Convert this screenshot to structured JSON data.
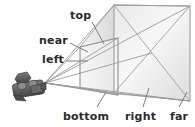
{
  "figure": {
    "background_color": "#ffffff",
    "width": 195,
    "height": 127
  },
  "labels": {
    "top": "top",
    "near": "near",
    "left": "left",
    "bottom": "bottom",
    "right": "right",
    "far": "far"
  },
  "colors": {
    "label_text": "#2b2b2b",
    "frustum_edge": "#9a9a9a",
    "frustum_fill_light": "#f2f2f2",
    "frustum_fill_mid": "#e2e2e2",
    "frustum_fill_dark": "#cfcfcf",
    "leader_line": "#8c8c8c",
    "camera_body": "#5e5e5e",
    "camera_shadow": "#3f3f3f",
    "camera_highlight": "#8f8f8f"
  },
  "geometry": {
    "camera_apex": {
      "x": 45,
      "y": 83
    },
    "near_plane": {
      "top_left": {
        "x": 80,
        "y": 47
      },
      "top_right": {
        "x": 118,
        "y": 38
      },
      "bottom_right": {
        "x": 118,
        "y": 95
      },
      "bottom_left": {
        "x": 80,
        "y": 88
      }
    },
    "far_plane": {
      "top_left": {
        "x": 114,
        "y": 5
      },
      "top_right": {
        "x": 190,
        "y": 6
      },
      "bottom_right": {
        "x": 190,
        "y": 101
      },
      "bottom_left": {
        "x": 114,
        "y": 93
      }
    }
  },
  "icons": {
    "camera": "video-camera-icon"
  }
}
